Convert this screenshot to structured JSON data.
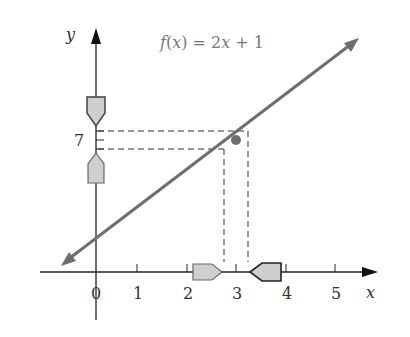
{
  "title": "f(x) = 2x + 1",
  "title_parts": {
    "f": "f",
    "open": "(",
    "x": "x",
    "close": ")",
    "rest": " = 2",
    "x2": "x",
    "tail": " + 1"
  },
  "axes": {
    "x_label": "x",
    "y_label": "y",
    "x_ticks": [
      "0",
      "1",
      "2",
      "3",
      "4",
      "5"
    ],
    "y_tick_label": "7"
  },
  "function": {
    "slope": 2,
    "intercept": 1
  },
  "highlight_point": {
    "x": 3,
    "y": 7
  },
  "colors": {
    "line": "#6e6e6e",
    "axis": "#222222",
    "arrow_fill": "#cfcfcf",
    "arrow_stroke": "#444444",
    "title": "#777777"
  }
}
